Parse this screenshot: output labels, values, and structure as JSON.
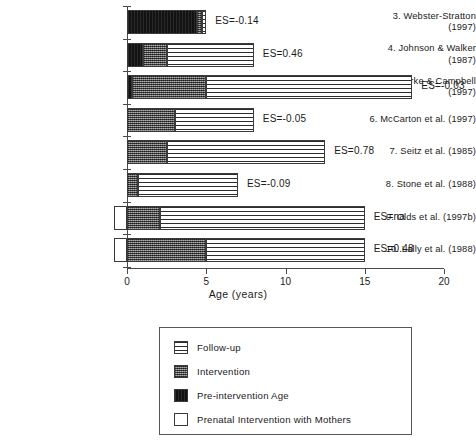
{
  "chart_data": {
    "type": "bar",
    "orientation": "horizontal",
    "title": "",
    "xlabel": "Age (years)",
    "ylabel": "",
    "xlim": [
      0,
      20
    ],
    "xticks": [
      0,
      5,
      10,
      15,
      20
    ],
    "xtick_labels": [
      "0",
      "5",
      "10",
      "15",
      "20"
    ],
    "grid": false,
    "stacked": true,
    "legend_position": "below-plot",
    "segment_order": [
      "prenatal",
      "preintervention",
      "intervention",
      "followup"
    ],
    "series": [
      {
        "name": "Prenatal Intervention with Mothers",
        "key": "prenatal",
        "values": [
          0,
          0,
          0,
          0,
          0,
          0,
          0.8,
          0.8
        ]
      },
      {
        "name": "Pre-intervention Age",
        "key": "preintervention",
        "values": [
          4.4,
          1.0,
          0.3,
          0,
          0,
          0,
          0,
          0
        ]
      },
      {
        "name": "Intervention",
        "key": "intervention",
        "values": [
          0.35,
          1.5,
          4.7,
          3.0,
          2.5,
          0.7,
          2.1,
          5.0
        ]
      },
      {
        "name": "Follow-up",
        "key": "followup",
        "values": [
          0.25,
          5.5,
          13.0,
          5.0,
          10.0,
          6.3,
          12.9,
          10.0
        ]
      }
    ],
    "categories": [
      "3. Webster-Stratton (1997)",
      "4. Johnson & Walker (1987)",
      "5. Clarke & Campbell (1997)",
      "6. McCarton et al. (1997)",
      "7. Seitz et al. (1985)",
      "8. Stone et al. (1988)",
      "9. Olds et al. (1997b)",
      "10. Lally et al. (1988)"
    ],
    "totals_end_age": [
      5.0,
      8.0,
      18.0,
      8.0,
      12.5,
      7.0,
      15.0,
      15.0
    ],
    "annotations": [
      "ES=-0.14",
      "ES=0.46",
      "ES=-0.03",
      "ES=-0.05",
      "ES=0.78",
      "ES=-0.09",
      "ES=na",
      "ES=0.48"
    ]
  },
  "rows": [
    {
      "label_line1": "3.  Webster-Stratton",
      "label_line2": "(1997)",
      "es": "ES=-0.14",
      "prenatal": 0,
      "preintervention": 4.4,
      "intervention": 0.35,
      "followup": 0.25
    },
    {
      "label_line1": "4.  Johnson & Walker",
      "label_line2": "(1987)",
      "es": "ES=0.46",
      "prenatal": 0,
      "preintervention": 1.0,
      "intervention": 1.5,
      "followup": 5.5
    },
    {
      "label_line1": "5. Clarke & Campbell",
      "label_line2": "(1997)",
      "es": "ES=-0.03",
      "prenatal": 0,
      "preintervention": 0.3,
      "intervention": 4.7,
      "followup": 13.0
    },
    {
      "label_line1": "6. McCarton et al. (1997)",
      "label_line2": "",
      "es": "ES=-0.05",
      "prenatal": 0,
      "preintervention": 0,
      "intervention": 3.0,
      "followup": 5.0
    },
    {
      "label_line1": "7.  Seitz et al. (1985)",
      "label_line2": "",
      "es": "ES=0.78",
      "prenatal": 0,
      "preintervention": 0,
      "intervention": 2.5,
      "followup": 10.0
    },
    {
      "label_line1": "8. Stone et al. (1988)",
      "label_line2": "",
      "es": "ES=-0.09",
      "prenatal": 0,
      "preintervention": 0,
      "intervention": 0.7,
      "followup": 6.3
    },
    {
      "label_line1": "9. Olds et al. (1997b)",
      "label_line2": "",
      "es": "ES=na",
      "prenatal": 0.8,
      "preintervention": 0,
      "intervention": 2.1,
      "followup": 12.9
    },
    {
      "label_line1": "10. Lally et al. (1988)",
      "label_line2": "",
      "es": "ES=0.48",
      "prenatal": 0.8,
      "preintervention": 0,
      "intervention": 5.0,
      "followup": 10.0
    }
  ],
  "axis": {
    "x_label": "Age (years)",
    "ticks": [
      "0",
      "5",
      "10",
      "15",
      "20"
    ]
  },
  "legend": {
    "items": [
      {
        "label": "Follow-up",
        "key": "followup"
      },
      {
        "label": "Intervention",
        "key": "intervention"
      },
      {
        "label": "Pre-intervention Age",
        "key": "preintervention"
      },
      {
        "label": "Prenatal Intervention with Mothers",
        "key": "prenatal"
      }
    ]
  },
  "colors": {
    "followup": "#ffffff",
    "intervention": "#6f6f6f",
    "preintervention": "#121212",
    "prenatal": "#ffffff",
    "axis": "#4a4a4a",
    "text": "#1a1a1a"
  }
}
